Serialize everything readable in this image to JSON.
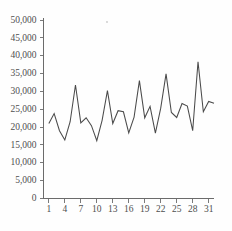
{
  "chart_data": {
    "type": "line",
    "title": "",
    "subtitle": "",
    "xlabel": "",
    "ylabel": "",
    "xlim": [
      0,
      32
    ],
    "ylim": [
      0,
      50000
    ],
    "grid": false,
    "legend": false,
    "legend_position": "none",
    "line_color": "#4a4a4a",
    "axis_color": "#6b6b6b",
    "background_color": "#fefefe",
    "y_ticks": [
      0,
      5000,
      10000,
      15000,
      20000,
      25000,
      30000,
      35000,
      40000,
      45000,
      50000
    ],
    "y_tick_labels": [
      "0",
      "5,000",
      "10,000",
      "15,000",
      "20,000",
      "25,000",
      "30,000",
      "35,000",
      "40,000",
      "45,000",
      "50,000"
    ],
    "x_ticks": [
      1,
      4,
      7,
      10,
      13,
      16,
      19,
      22,
      25,
      28,
      31
    ],
    "x_tick_labels": [
      "1",
      "4",
      "7",
      "10",
      "13",
      "16",
      "19",
      "22",
      "25",
      "28",
      "31"
    ],
    "x": [
      1,
      2,
      3,
      4,
      5,
      6,
      7,
      8,
      9,
      10,
      11,
      12,
      13,
      14,
      15,
      16,
      17,
      18,
      19,
      20,
      21,
      22,
      23,
      24,
      25,
      26,
      27,
      28,
      29,
      30,
      31,
      32
    ],
    "values": [
      21000,
      23800,
      19000,
      16400,
      21500,
      31800,
      21200,
      22600,
      20400,
      16200,
      21900,
      30200,
      21000,
      24600,
      24300,
      18400,
      22800,
      33000,
      22600,
      25800,
      18300,
      25300,
      34900,
      24100,
      22700,
      26600,
      25900,
      19000,
      38300,
      24300,
      27200,
      26700
    ],
    "series_name": "daily value"
  }
}
